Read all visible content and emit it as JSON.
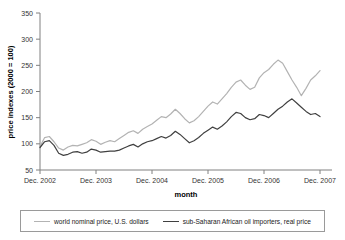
{
  "chart_data": {
    "type": "line",
    "title": "",
    "xlabel": "month",
    "ylabel": "price indexes (2000 = 100)",
    "ylim": [
      50,
      350
    ],
    "yticks": [
      50,
      100,
      150,
      200,
      250,
      300,
      350
    ],
    "xticks": [
      "Dec. 2002",
      "Dec. 2003",
      "Dec. 2004",
      "Dec. 2005",
      "Dec. 2006",
      "Dec. 2007"
    ],
    "grid": false,
    "legend_position": "bottom",
    "x_start": "Dec. 2002",
    "x_end": "Dec. 2007",
    "x_interval": "monthly",
    "n_points": 61,
    "series": [
      {
        "name": "world nominal price, U.S. dollars",
        "color": "#b3b3b3",
        "values": [
          95,
          112,
          114,
          104,
          92,
          88,
          94,
          97,
          96,
          99,
          102,
          108,
          105,
          99,
          103,
          106,
          104,
          110,
          116,
          122,
          125,
          120,
          128,
          133,
          138,
          145,
          152,
          150,
          157,
          166,
          158,
          148,
          140,
          144,
          152,
          162,
          172,
          180,
          176,
          186,
          196,
          208,
          218,
          222,
          212,
          204,
          208,
          226,
          236,
          242,
          252,
          260,
          254,
          238,
          222,
          208,
          192,
          206,
          222,
          230,
          240,
          252,
          264,
          250,
          262,
          286,
          300,
          318,
          326,
          322
        ]
      },
      {
        "name": "sub-Saharan African oil importers, real price",
        "color": "#404040",
        "values": [
          93,
          104,
          106,
          97,
          82,
          78,
          80,
          84,
          85,
          82,
          84,
          90,
          88,
          84,
          85,
          86,
          86,
          88,
          92,
          96,
          99,
          94,
          100,
          104,
          106,
          110,
          114,
          111,
          116,
          124,
          118,
          110,
          102,
          106,
          112,
          120,
          126,
          132,
          128,
          134,
          142,
          152,
          160,
          158,
          150,
          146,
          148,
          156,
          154,
          150,
          158,
          166,
          172,
          180,
          186,
          178,
          170,
          162,
          156,
          158,
          152,
          144,
          135,
          140,
          150,
          156,
          152,
          160,
          172,
          166,
          176,
          190,
          202,
          195
        ]
      }
    ]
  },
  "legend": {
    "items": [
      {
        "label": "world nominal price, U.S. dollars",
        "color": "#b3b3b3",
        "thickness": "1.2px"
      },
      {
        "label": "sub-Saharan African oil importers, real price",
        "color": "#404040",
        "thickness": "1.8px"
      }
    ]
  }
}
